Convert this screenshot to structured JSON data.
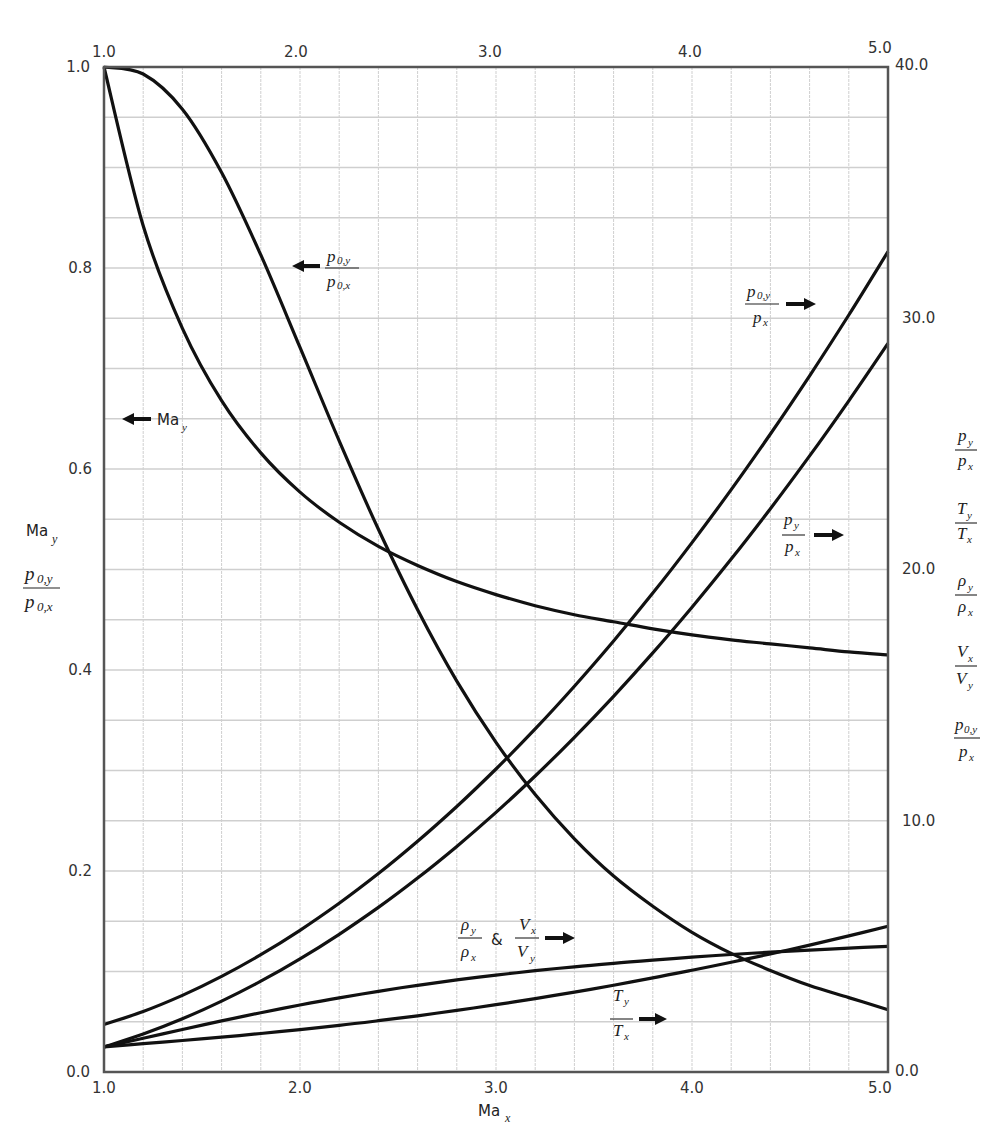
{
  "chart_data": {
    "type": "line",
    "title": "",
    "xlabel": "Ma_x",
    "x_axis": {
      "min": 1.0,
      "max": 5.0,
      "ticks": [
        "1.0",
        "2.0",
        "3.0",
        "4.0",
        "5.0"
      ],
      "top_ticks": [
        "1.0",
        "2.0",
        "3.0",
        "4.0",
        "5.0"
      ]
    },
    "left_axis": {
      "min": 0.0,
      "max": 1.0,
      "ticks": [
        "0.0",
        "0.2",
        "0.4",
        "0.6",
        "0.8",
        "1.0"
      ],
      "labels": [
        "Ma_y",
        "p_0,y / p_0,x"
      ]
    },
    "right_axis": {
      "min": 0.0,
      "max": 40.0,
      "ticks": [
        "0.0",
        "10.0",
        "20.0",
        "30.0",
        "40.0"
      ],
      "labels": [
        "p_y / p_x",
        "T_y / T_x",
        "ρ_y / ρ_x",
        "V_x / V_y",
        "p_0,y / p_x"
      ]
    },
    "grid": true,
    "legend_position": "inline annotations with arrows",
    "x": [
      1.0,
      1.2,
      1.4,
      1.6,
      1.8,
      2.0,
      2.2,
      2.4,
      2.6,
      2.8,
      3.0,
      3.2,
      3.4,
      3.6,
      3.8,
      4.0,
      4.2,
      4.4,
      4.6,
      4.8,
      5.0
    ],
    "series": [
      {
        "name": "Ma_y",
        "axis": "left",
        "annotation": "← Ma_y",
        "values": [
          1.0,
          0.842,
          0.74,
          0.668,
          0.616,
          0.577,
          0.547,
          0.523,
          0.504,
          0.488,
          0.475,
          0.464,
          0.455,
          0.448,
          0.441,
          0.435,
          0.43,
          0.426,
          0.422,
          0.418,
          0.415
        ]
      },
      {
        "name": "p_0,y / p_0,x",
        "axis": "left",
        "annotation": "← p_0,y / p_0,x",
        "values": [
          1.0,
          0.993,
          0.958,
          0.895,
          0.813,
          0.721,
          0.628,
          0.54,
          0.46,
          0.389,
          0.328,
          0.276,
          0.232,
          0.195,
          0.165,
          0.139,
          0.118,
          0.101,
          0.086,
          0.074,
          0.062
        ]
      },
      {
        "name": "p_0,y / p_x",
        "axis": "right",
        "annotation": "p_0,y / p_x →",
        "values": [
          1.893,
          2.407,
          3.049,
          3.805,
          4.67,
          5.64,
          6.716,
          7.896,
          9.181,
          10.569,
          12.061,
          13.656,
          15.354,
          17.156,
          19.061,
          21.069,
          23.18,
          25.394,
          27.711,
          30.131,
          32.654
        ]
      },
      {
        "name": "p_y / p_x",
        "axis": "right",
        "annotation": "p_y / p_x →",
        "values": [
          1.0,
          1.513,
          2.12,
          2.82,
          3.613,
          4.5,
          5.48,
          6.553,
          7.72,
          8.98,
          10.333,
          11.78,
          13.32,
          14.953,
          16.68,
          18.5,
          20.413,
          22.42,
          24.52,
          26.713,
          29.0
        ]
      },
      {
        "name": "ρ_y / ρ_x & V_x / V_y",
        "axis": "right",
        "annotation": "ρ_y / ρ_x & V_x / V_y →",
        "values": [
          1.0,
          1.342,
          1.69,
          2.032,
          2.359,
          2.667,
          2.951,
          3.212,
          3.449,
          3.664,
          3.857,
          4.031,
          4.188,
          4.328,
          4.455,
          4.571,
          4.675,
          4.768,
          4.853,
          4.931,
          5.0
        ]
      },
      {
        "name": "T_y / T_x",
        "axis": "right",
        "annotation": "T_y / T_x →",
        "values": [
          1.0,
          1.128,
          1.255,
          1.388,
          1.532,
          1.688,
          1.857,
          2.04,
          2.238,
          2.451,
          2.679,
          2.922,
          3.18,
          3.455,
          3.744,
          4.047,
          4.367,
          4.702,
          5.052,
          5.418,
          5.8
        ]
      }
    ]
  },
  "annotations": {
    "ma_y": {
      "base": "Ma",
      "sub": "y"
    },
    "p0y_p0x": {
      "num": "p",
      "num_sub": "0,y",
      "den": "p",
      "den_sub": "0,x"
    },
    "p0y_px": {
      "num": "p",
      "num_sub": "0,y",
      "den": "p",
      "den_sub": "x"
    },
    "py_px": {
      "num": "p",
      "num_sub": "y",
      "den": "p",
      "den_sub": "x"
    },
    "ty_tx": {
      "num": "T",
      "num_sub": "y",
      "den": "T",
      "den_sub": "x"
    },
    "rho_vel": {
      "num1": "ρ",
      "num1_sub": "y",
      "den1": "ρ",
      "den1_sub": "x",
      "amp": "&",
      "num2": "V",
      "num2_sub": "x",
      "den2": "V",
      "den2_sub": "y"
    },
    "rho": {
      "num": "ρ",
      "num_sub": "y",
      "den": "ρ",
      "den_sub": "x"
    },
    "vel": {
      "num": "V",
      "num_sub": "x",
      "den": "V",
      "den_sub": "y"
    }
  },
  "colors": {
    "curve": "#111111",
    "frame": "#555555",
    "grid_minor": "#cfcfcf",
    "grid_major": "#b9b9b9",
    "text": "#333333"
  }
}
